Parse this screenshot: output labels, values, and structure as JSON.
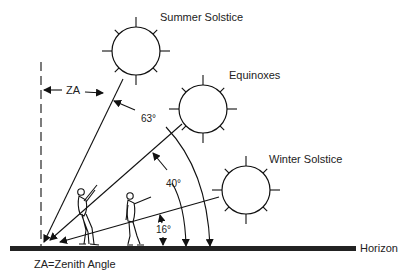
{
  "labels": {
    "summer": "Summer Solstice",
    "equinox": "Equinoxes",
    "winter": "Winter Solstice",
    "horizon": "Horizon",
    "za": "ZA",
    "legend": "ZA=Zenith Angle"
  },
  "angles": {
    "summer": "63°",
    "equinox": "40°",
    "winter": "16°"
  },
  "colors": {
    "ink": "#111111",
    "background": "#ffffff"
  }
}
